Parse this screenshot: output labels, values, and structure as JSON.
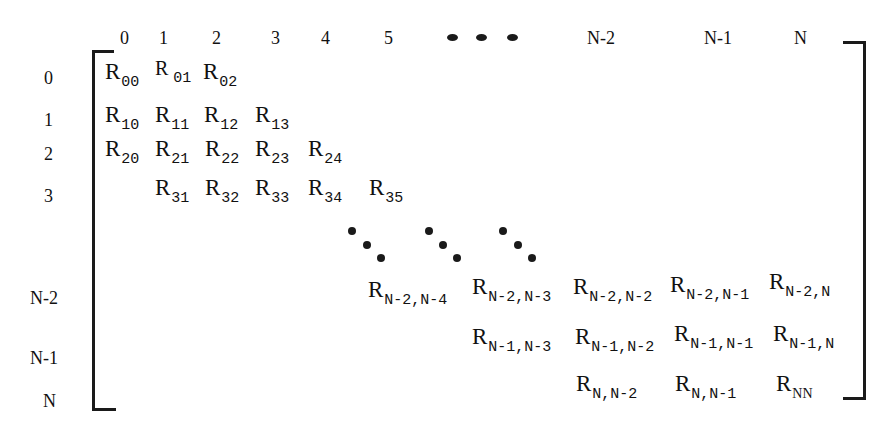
{
  "diagram": {
    "type": "banded-matrix",
    "column_headers": [
      "0",
      "1",
      "2",
      "3",
      "4",
      "5",
      "N-2",
      "N-1",
      "N"
    ],
    "row_headers": [
      "0",
      "1",
      "2",
      "3",
      "N-2",
      "N-1",
      "N"
    ],
    "ellipsis": "horizontal-dots",
    "cells": [
      {
        "row": "0",
        "label": "R",
        "sub": "00"
      },
      {
        "row": "0",
        "label": "R",
        "sub": "01"
      },
      {
        "row": "0",
        "label": "R",
        "sub": "02"
      },
      {
        "row": "1",
        "label": "R",
        "sub": "10"
      },
      {
        "row": "1",
        "label": "R",
        "sub": "11"
      },
      {
        "row": "1",
        "label": "R",
        "sub": "12"
      },
      {
        "row": "1",
        "label": "R",
        "sub": "13"
      },
      {
        "row": "2",
        "label": "R",
        "sub": "20"
      },
      {
        "row": "2",
        "label": "R",
        "sub": "21"
      },
      {
        "row": "2",
        "label": "R",
        "sub": "22"
      },
      {
        "row": "2",
        "label": "R",
        "sub": "23"
      },
      {
        "row": "2",
        "label": "R",
        "sub": "24"
      },
      {
        "row": "3",
        "label": "R",
        "sub": "31"
      },
      {
        "row": "3",
        "label": "R",
        "sub": "32"
      },
      {
        "row": "3",
        "label": "R",
        "sub": "33"
      },
      {
        "row": "3",
        "label": "R",
        "sub": "34"
      },
      {
        "row": "3",
        "label": "R",
        "sub": "35"
      },
      {
        "row": "N-2",
        "label": "R",
        "sub": "N-2,N-4"
      },
      {
        "row": "N-2",
        "label": "R",
        "sub": "N-2,N-3"
      },
      {
        "row": "N-2",
        "label": "R",
        "sub": "N-2,N-2"
      },
      {
        "row": "N-2",
        "label": "R",
        "sub": "N-2,N-1"
      },
      {
        "row": "N-2",
        "label": "R",
        "sub": "N-2,N"
      },
      {
        "row": "N-1",
        "label": "R",
        "sub": "N-1,N-3"
      },
      {
        "row": "N-1",
        "label": "R",
        "sub": "N-1,N-2"
      },
      {
        "row": "N-1",
        "label": "R",
        "sub": "N-1,N-1"
      },
      {
        "row": "N-1",
        "label": "R",
        "sub": "N-1,N"
      },
      {
        "row": "N",
        "label": "R",
        "sub": "N,N-2"
      },
      {
        "row": "N",
        "label": "R",
        "sub": "N,N-1"
      },
      {
        "row": "N",
        "label": "R",
        "sub": "NN"
      }
    ]
  }
}
